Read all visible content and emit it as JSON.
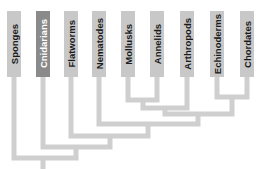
{
  "diagram": {
    "type": "cladogram",
    "colors": {
      "bar": "#c8c8c8",
      "highlight_bar": "#8a8a8a",
      "branch": "#cfcfcf",
      "label": "#1a1a1a",
      "highlight_label": "#ffffff"
    },
    "taxa": [
      {
        "label": "Sponges",
        "left": 7,
        "highlight": false
      },
      {
        "label": "Cnidarians",
        "left": 36,
        "highlight": true
      },
      {
        "label": "Flatworms",
        "left": 64,
        "highlight": false
      },
      {
        "label": "Nematodes",
        "left": 92,
        "highlight": false
      },
      {
        "label": "Mollusks",
        "left": 121,
        "highlight": false
      },
      {
        "label": "Annelids",
        "left": 150,
        "highlight": false
      },
      {
        "label": "Arthropods",
        "left": 180,
        "highlight": false
      },
      {
        "label": "Echinoderms",
        "left": 210,
        "highlight": false
      },
      {
        "label": "Chordates",
        "left": 240,
        "highlight": false
      }
    ],
    "branches": [
      "M128 77 V100 H157 V77",
      "M217 77 V97 H247 V77",
      "M143 100 V108 H187 V77",
      "M165 108 V114 H232 V97",
      "M99 77 V124 H198 V114",
      "M71 77 V136 H148 V124",
      "M43 77 V147 H110 V136",
      "M14 77 V158 H76 V147",
      "M43 158 V169"
    ]
  }
}
